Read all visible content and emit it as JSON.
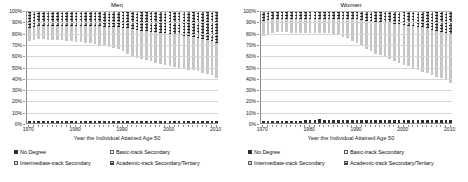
{
  "figure": {
    "panels": [
      {
        "key": "men",
        "title": "Men"
      },
      {
        "key": "women",
        "title": "Women"
      }
    ],
    "xlabel": "Year the Individual Attained Age 50",
    "ylabel": "",
    "y_ticks": [
      "0%",
      "10%",
      "20%",
      "30%",
      "40%",
      "50%",
      "60%",
      "70%",
      "80%",
      "90%",
      "100%"
    ],
    "x_ticks": [
      "1970",
      "1980",
      "1990",
      "2000",
      "2010"
    ],
    "legend": [
      {
        "key": "s0",
        "label": "No Degree"
      },
      {
        "key": "s1",
        "label": "Basic-track Secondary"
      },
      {
        "key": "s2",
        "label": "Intermediate-track Secondary"
      },
      {
        "key": "s3",
        "label": "Academic-track Secondary/Tertiary"
      }
    ],
    "colors": {
      "no_degree": "#2e2e2e",
      "basic_track": "#ffffff",
      "intermediate_track": "#c6c6c6",
      "academic_track": "#6e6e6e",
      "axis": "#8d8d8d",
      "grid": "#d6d6d6"
    }
  },
  "chart_data": [
    {
      "type": "bar",
      "subtype": "stacked-percentage",
      "title": "Men",
      "xlabel": "Year the Individual Attained Age 50",
      "ylabel": "",
      "ylim": [
        0,
        100
      ],
      "y_ticks": [
        0,
        10,
        20,
        30,
        40,
        50,
        60,
        70,
        80,
        90,
        100
      ],
      "grid": true,
      "legend_position": "bottom",
      "categories": [
        1970,
        1971,
        1972,
        1973,
        1974,
        1975,
        1976,
        1977,
        1978,
        1979,
        1980,
        1981,
        1982,
        1983,
        1984,
        1985,
        1986,
        1987,
        1988,
        1989,
        1990,
        1991,
        1992,
        1993,
        1994,
        1995,
        1996,
        1997,
        1998,
        1999,
        2000,
        2001,
        2002,
        2003,
        2004,
        2005,
        2006,
        2007,
        2008,
        2009,
        2010
      ],
      "series": [
        {
          "name": "No Degree",
          "values": [
            2.0,
            2.0,
            2.0,
            2.0,
            2.0,
            2.0,
            2.0,
            2.0,
            2.0,
            2.0,
            2.0,
            2.0,
            2.0,
            2.0,
            2.0,
            2.0,
            2.0,
            2.0,
            2.0,
            2.0,
            2.0,
            2.0,
            2.0,
            2.0,
            2.0,
            2.0,
            2.0,
            2.0,
            2.0,
            2.0,
            2.0,
            2.0,
            2.0,
            2.0,
            2.0,
            2.0,
            2.0,
            2.0,
            2.0,
            2.0,
            2.0
          ]
        },
        {
          "name": "Basic-track Secondary",
          "values": [
            71.0,
            72.0,
            73.0,
            73.0,
            72.5,
            72.5,
            72.0,
            72.0,
            71.5,
            71.0,
            70.5,
            70.0,
            69.5,
            69.0,
            68.5,
            68.0,
            67.0,
            66.0,
            65.0,
            64.0,
            62.0,
            60.0,
            58.0,
            56.0,
            55.0,
            54.0,
            53.0,
            52.0,
            51.0,
            50.0,
            49.0,
            48.0,
            47.0,
            46.5,
            45.5,
            45.0,
            44.0,
            43.0,
            42.0,
            41.0,
            38.5
          ]
        },
        {
          "name": "Intermediate-track Secondary",
          "values": [
            12.0,
            12.0,
            12.0,
            12.0,
            12.5,
            12.5,
            13.0,
            13.0,
            13.5,
            14.0,
            14.0,
            14.5,
            15.0,
            15.5,
            16.0,
            16.5,
            17.0,
            17.5,
            18.5,
            19.5,
            21.0,
            22.5,
            24.0,
            25.0,
            25.5,
            26.0,
            26.5,
            27.0,
            27.5,
            28.0,
            28.5,
            29.0,
            29.5,
            29.5,
            30.0,
            30.0,
            30.0,
            30.0,
            30.0,
            30.0,
            30.5
          ]
        },
        {
          "name": "Academic-track Secondary/Tertiary",
          "values": [
            15.0,
            14.0,
            13.0,
            13.0,
            13.0,
            13.0,
            13.0,
            13.0,
            13.0,
            13.0,
            13.5,
            13.5,
            13.5,
            13.5,
            13.5,
            13.5,
            14.0,
            14.5,
            14.5,
            14.5,
            15.0,
            15.5,
            16.0,
            17.0,
            17.5,
            18.0,
            18.5,
            19.0,
            19.5,
            20.0,
            20.5,
            21.0,
            21.5,
            22.0,
            22.5,
            23.0,
            24.0,
            25.0,
            26.0,
            27.0,
            29.0
          ]
        }
      ]
    },
    {
      "type": "bar",
      "subtype": "stacked-percentage",
      "title": "Women",
      "xlabel": "Year the Individual Attained Age 50",
      "ylabel": "",
      "ylim": [
        0,
        100
      ],
      "y_ticks": [
        0,
        10,
        20,
        30,
        40,
        50,
        60,
        70,
        80,
        90,
        100
      ],
      "grid": true,
      "legend_position": "bottom",
      "categories": [
        1970,
        1971,
        1972,
        1973,
        1974,
        1975,
        1976,
        1977,
        1978,
        1979,
        1980,
        1981,
        1982,
        1983,
        1984,
        1985,
        1986,
        1987,
        1988,
        1989,
        1990,
        1991,
        1992,
        1993,
        1994,
        1995,
        1996,
        1997,
        1998,
        1999,
        2000,
        2001,
        2002,
        2003,
        2004,
        2005,
        2006,
        2007,
        2008,
        2009,
        2010
      ],
      "series": [
        {
          "name": "No Degree",
          "values": [
            2.0,
            2.0,
            2.0,
            2.0,
            2.0,
            2.0,
            2.0,
            2.0,
            2.0,
            2.5,
            2.5,
            3.0,
            3.5,
            3.0,
            2.5,
            2.5,
            2.5,
            2.5,
            2.5,
            2.5,
            2.5,
            2.5,
            2.5,
            2.5,
            2.5,
            2.5,
            2.5,
            2.5,
            2.5,
            2.5,
            2.5,
            2.5,
            2.5,
            2.5,
            2.5,
            2.5,
            2.5,
            2.5,
            2.5,
            2.5,
            2.5
          ]
        },
        {
          "name": "Basic-track Secondary",
          "values": [
            76.0,
            77.5,
            78.5,
            79.0,
            79.0,
            79.0,
            78.5,
            78.5,
            78.0,
            77.5,
            77.5,
            77.0,
            77.0,
            77.5,
            78.0,
            77.0,
            76.0,
            74.5,
            73.0,
            71.0,
            69.0,
            66.5,
            64.0,
            61.5,
            59.5,
            58.0,
            56.0,
            54.5,
            53.0,
            51.0,
            49.5,
            48.0,
            46.5,
            45.0,
            43.5,
            42.0,
            40.5,
            39.0,
            37.5,
            36.0,
            33.5
          ]
        },
        {
          "name": "Intermediate-track Secondary",
          "values": [
            13.0,
            12.5,
            12.0,
            11.5,
            11.5,
            11.5,
            12.0,
            12.0,
            12.5,
            12.5,
            12.5,
            12.5,
            12.5,
            12.5,
            12.5,
            13.5,
            14.5,
            16.0,
            17.5,
            19.5,
            21.0,
            23.0,
            25.0,
            27.0,
            28.5,
            29.5,
            31.0,
            32.0,
            33.0,
            34.5,
            35.5,
            36.5,
            37.5,
            38.5,
            39.5,
            40.0,
            40.5,
            41.0,
            41.5,
            42.0,
            42.5
          ]
        },
        {
          "name": "Academic-track Secondary/Tertiary",
          "values": [
            9.0,
            8.0,
            7.5,
            7.5,
            7.5,
            7.5,
            7.5,
            7.5,
            7.5,
            7.5,
            7.5,
            7.5,
            7.0,
            7.0,
            7.0,
            7.0,
            7.0,
            7.0,
            7.0,
            7.0,
            7.5,
            8.0,
            8.5,
            9.0,
            9.5,
            10.0,
            10.5,
            11.0,
            11.5,
            12.0,
            12.5,
            13.0,
            13.5,
            14.0,
            14.5,
            15.5,
            16.5,
            17.5,
            18.5,
            19.5,
            21.5
          ]
        }
      ]
    }
  ]
}
